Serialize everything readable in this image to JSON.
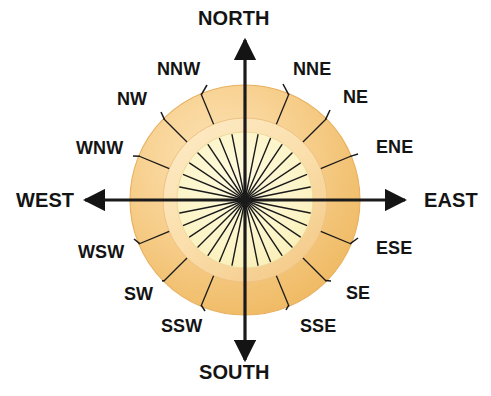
{
  "diagram": {
    "type": "compass-rose",
    "background_color": "#ffffff",
    "center": {
      "x": 245,
      "y": 200
    },
    "geometry": {
      "outer_circle_radius": 115,
      "mid_ring_radius": 82,
      "inner_circle_radius": 68,
      "spoke_count": 32,
      "arrow_tip_radius": 160
    },
    "colors": {
      "outer_ring_fill": "#F2C273",
      "outer_ring_fill_light": "#FBDFAE",
      "mid_ring_fill": "#FBE2B2",
      "inner_circle_fill": "#FCF5C9",
      "ring_edge": "#E8B05E",
      "line": "#1a1a1a",
      "text": "#141414"
    }
  },
  "points": {
    "cardinals": [
      {
        "name": "north",
        "label": "NORTH",
        "bearing_deg": 0,
        "label_x": 198,
        "label_y": 8,
        "arrow": "up"
      },
      {
        "name": "east",
        "label": "EAST",
        "bearing_deg": 90,
        "label_x": 424,
        "label_y": 190,
        "arrow": "right"
      },
      {
        "name": "south",
        "label": "SOUTH",
        "bearing_deg": 180,
        "label_x": 199,
        "label_y": 362,
        "arrow": "down"
      },
      {
        "name": "west",
        "label": "WEST",
        "bearing_deg": 270,
        "label_x": 16,
        "label_y": 190,
        "arrow": "left"
      }
    ],
    "intercardinals": [
      {
        "name": "nne",
        "label": "NNE",
        "bearing_deg": 22.5,
        "label_x": 293,
        "label_y": 60,
        "leader_end_x": 283,
        "leader_end_y": 84
      },
      {
        "name": "ne",
        "label": "NE",
        "bearing_deg": 45,
        "label_x": 343,
        "label_y": 88,
        "leader_end_x": 330,
        "leader_end_y": 110
      },
      {
        "name": "ene",
        "label": "ENE",
        "bearing_deg": 67.5,
        "label_x": 376,
        "label_y": 138,
        "leader_end_x": 358,
        "leader_end_y": 154
      },
      {
        "name": "ese",
        "label": "ESE",
        "bearing_deg": 112.5,
        "label_x": 376,
        "label_y": 239,
        "leader_end_x": 358,
        "leader_end_y": 238
      },
      {
        "name": "se",
        "label": "SE",
        "bearing_deg": 135,
        "label_x": 346,
        "label_y": 284,
        "leader_end_x": 331,
        "leader_end_y": 281
      },
      {
        "name": "sse",
        "label": "SSE",
        "bearing_deg": 157.5,
        "label_x": 300,
        "label_y": 317,
        "leader_end_x": 286,
        "leader_end_y": 310
      },
      {
        "name": "ssw",
        "label": "SSW",
        "bearing_deg": 202.5,
        "label_x": 161,
        "label_y": 317,
        "leader_end_x": 205,
        "leader_end_y": 311
      },
      {
        "name": "sw",
        "label": "SW",
        "bearing_deg": 225,
        "label_x": 124,
        "label_y": 285,
        "leader_end_x": 162,
        "leader_end_y": 281
      },
      {
        "name": "wsw",
        "label": "WSW",
        "bearing_deg": 247.5,
        "label_x": 78,
        "label_y": 243,
        "leader_end_x": 134,
        "leader_end_y": 239
      },
      {
        "name": "wnw",
        "label": "WNW",
        "bearing_deg": 292.5,
        "label_x": 76,
        "label_y": 139,
        "leader_end_x": 133,
        "leader_end_y": 156
      },
      {
        "name": "nw",
        "label": "NW",
        "bearing_deg": 315,
        "label_x": 117,
        "label_y": 90,
        "leader_end_x": 161,
        "leader_end_y": 112
      },
      {
        "name": "nnw",
        "label": "NNW",
        "bearing_deg": 337.5,
        "label_x": 157,
        "label_y": 60,
        "leader_end_x": 207,
        "leader_end_y": 85
      }
    ]
  }
}
